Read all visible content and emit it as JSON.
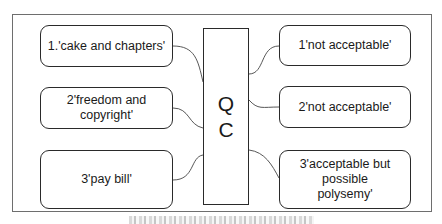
{
  "diagram": {
    "center_box": {
      "line1": "Q",
      "line2": "C"
    },
    "inputs": [
      {
        "label": "1.'cake and chapters'"
      },
      {
        "label": "2'freedom and copyright'"
      },
      {
        "label": "3'pay bill'"
      }
    ],
    "outputs": [
      {
        "label": "1'not acceptable'"
      },
      {
        "label": "2'not acceptable'"
      },
      {
        "label": "3'acceptable but possible polysemy'"
      }
    ],
    "caption": ""
  }
}
